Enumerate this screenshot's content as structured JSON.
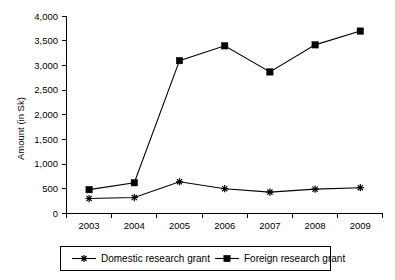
{
  "chart_data": {
    "type": "line",
    "title": "",
    "xlabel": "",
    "ylabel": "Amount (in Sk)",
    "categories": [
      "2003",
      "2004",
      "2005",
      "2006",
      "2007",
      "2008",
      "2009"
    ],
    "ylim": [
      0,
      4000
    ],
    "ytick_values": [
      0,
      500,
      1000,
      1500,
      2000,
      2500,
      3000,
      3500,
      4000
    ],
    "ytick_labels": [
      "0",
      "500",
      "1,000",
      "1,500",
      "2,000",
      "2,500",
      "3,000",
      "3,500",
      "4,000"
    ],
    "grid": false,
    "legend_position": "bottom",
    "series": [
      {
        "name": "Domestic research grant",
        "marker": "star",
        "color": "#000000",
        "values": [
          300,
          320,
          640,
          500,
          430,
          490,
          520
        ]
      },
      {
        "name": "Foreign research grant",
        "marker": "square",
        "color": "#000000",
        "values": [
          480,
          620,
          3100,
          3400,
          2870,
          3420,
          3700
        ]
      }
    ]
  },
  "legend": {
    "items": [
      {
        "label": "Domestic research grant",
        "marker": "star"
      },
      {
        "label": "Foreign research grant",
        "marker": "square"
      }
    ]
  },
  "colors": {
    "background": "#ffffff",
    "ink": "#000000"
  }
}
